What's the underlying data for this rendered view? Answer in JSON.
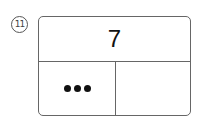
{
  "problem": {
    "number_label": "11",
    "whole": "7",
    "part_left": {
      "representation": "dots",
      "dot_count": 3
    },
    "part_right": ""
  }
}
